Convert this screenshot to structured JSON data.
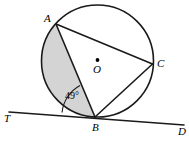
{
  "figure": {
    "background_color": "#ffffff",
    "stroke_color": "#1a1a1a",
    "shaded_fill_color": "#d4d4d4",
    "labels": {
      "point_a": "A",
      "point_b": "B",
      "point_c": "C",
      "center_o": "O",
      "tangent_left": "T",
      "tangent_right": "D",
      "angle_value": "49°"
    },
    "geometry": {
      "circle": {
        "cx": 97.5,
        "cy": 61,
        "r": 56
      },
      "points": {
        "A": {
          "x": 56,
          "y": 24
        },
        "B": {
          "x": 95,
          "y": 117
        },
        "C": {
          "x": 152.5,
          "y": 64
        },
        "O": {
          "x": 97.5,
          "y": 61
        }
      },
      "tangent_line": {
        "x1": 9,
        "y1": 112,
        "x2": 184,
        "y2": 125
      },
      "chords": [
        {
          "name": "AB",
          "from": "A",
          "to": "B"
        },
        {
          "name": "AC",
          "from": "A",
          "to": "C"
        },
        {
          "name": "BC",
          "from": "B",
          "to": "C"
        }
      ],
      "shaded_region": "circular segment bounded by chord AB and the minor arc from A to B on the left side",
      "angle_marked": "tangent-chord angle ABT between tangent ray BT and chord BA"
    }
  }
}
